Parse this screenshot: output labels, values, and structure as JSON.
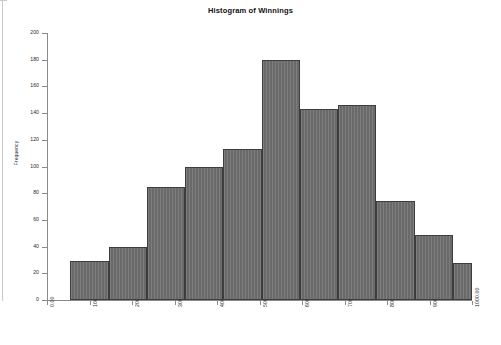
{
  "chart_data": {
    "type": "bar",
    "title": "Histogram of Winnings",
    "xlabel": "",
    "ylabel": "Frequency",
    "xlim": [
      0,
      1000
    ],
    "ylim": [
      0,
      200
    ],
    "grid": false,
    "legend": "none",
    "bin_width": 90,
    "bin_starts": [
      55,
      145,
      235,
      325,
      415,
      505,
      595,
      685,
      775,
      865,
      955
    ],
    "bin_edges": [
      55,
      145,
      235,
      325,
      415,
      505,
      595,
      685,
      775,
      865,
      955,
      1000
    ],
    "categories": [
      "55-145",
      "145-235",
      "235-325",
      "325-415",
      "415-505",
      "505-595",
      "595-685",
      "685-775",
      "775-865",
      "865-955",
      "955-1000"
    ],
    "values": [
      29,
      40,
      85,
      100,
      113,
      180,
      143,
      146,
      74,
      49,
      28
    ],
    "x_tick_labels": [
      "0.00",
      "100.00",
      "200.00",
      "300.00",
      "400.00",
      "500.00",
      "600.00",
      "700.00",
      "800.00",
      "900.00",
      "1000.00"
    ],
    "x_tick_values": [
      0,
      100,
      200,
      300,
      400,
      500,
      600,
      700,
      800,
      900,
      1000
    ],
    "y_tick_labels": [
      "0",
      "20",
      "40",
      "60",
      "80",
      "100",
      "120",
      "140",
      "160",
      "180",
      "200"
    ],
    "y_tick_values": [
      0,
      20,
      40,
      60,
      80,
      100,
      120,
      140,
      160,
      180,
      200
    ],
    "colors": {
      "bar_fill": "#6f6f6f",
      "bar_edge": "#3d3d3d",
      "axis": "#8a8a8a",
      "text": "#2b2b2b",
      "background": "#ffffff"
    }
  }
}
